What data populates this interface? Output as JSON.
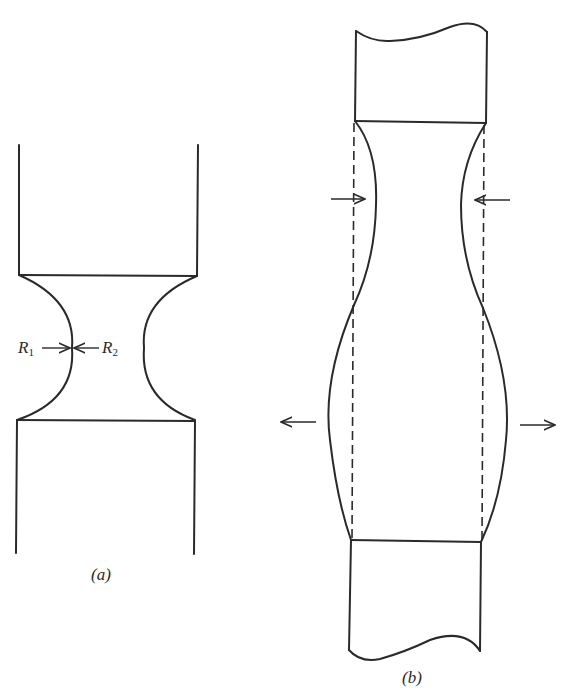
{
  "figure_a": {
    "caption": "(a)",
    "labels": {
      "r1": "R",
      "r1_sub": "1",
      "r2": "R",
      "r2_sub": "2"
    },
    "description": "Specimen with concave neck showing principal radii of curvature R1 and R2"
  },
  "figure_b": {
    "caption": "(b)",
    "description": "Cylindrical specimen with dashed original outline; upper region necks inward, lower region bulges outward",
    "arrows": {
      "inward": [
        "right-pointing arrow at left",
        "left-pointing arrow at right"
      ],
      "outward": [
        "left-pointing arrow at left",
        "right-pointing arrow at right"
      ]
    }
  },
  "colors": {
    "ink": "#2a2a2a",
    "background": "#ffffff"
  }
}
